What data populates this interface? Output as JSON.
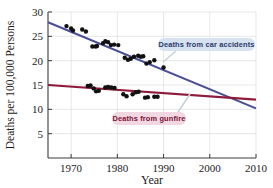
{
  "figure": {
    "background_color": "#ffffff",
    "plot_area": {
      "left": 48,
      "right": 256,
      "top": 12,
      "bottom": 158
    },
    "grid": "on",
    "grid_color": "#dcdcdc",
    "axis_color": "#3a3a3a"
  },
  "chart_data": {
    "type": "scatter",
    "title": "",
    "xlabel": "Year",
    "ylabel": "Deaths per 100,000 Persons",
    "xlim": [
      1965,
      2010
    ],
    "ylim": [
      0,
      30
    ],
    "xticks": [
      1970,
      1980,
      1990,
      2000,
      2010
    ],
    "yticks": [
      5,
      10,
      15,
      20,
      25,
      30
    ],
    "grid": true,
    "legend_position": "inline-annotations",
    "series": [
      {
        "name": "Deaths from car accidents",
        "color": "#4a4f93",
        "marker_color": "#111111",
        "annotation": "Deaths from car accidents",
        "annotation_bg": "#d6e2f0",
        "annotation_fg": "#2c3a6b",
        "trend_line": {
          "x": [
            1965,
            2010
          ],
          "y": [
            27.9,
            10.2
          ]
        },
        "points": [
          {
            "x": 1969,
            "y": 27.1
          },
          {
            "x": 1970,
            "y": 26.6
          },
          {
            "x": 1970.4,
            "y": 26.2
          },
          {
            "x": 1972.4,
            "y": 26.4
          },
          {
            "x": 1973.2,
            "y": 26.0
          },
          {
            "x": 1974.6,
            "y": 22.9
          },
          {
            "x": 1975.3,
            "y": 22.9
          },
          {
            "x": 1975.6,
            "y": 23.0
          },
          {
            "x": 1976.9,
            "y": 23.6
          },
          {
            "x": 1977.4,
            "y": 24.0
          },
          {
            "x": 1978.0,
            "y": 23.8
          },
          {
            "x": 1978.6,
            "y": 23.2
          },
          {
            "x": 1979.3,
            "y": 23.3
          },
          {
            "x": 1980.2,
            "y": 23.2
          },
          {
            "x": 1981.6,
            "y": 20.6
          },
          {
            "x": 1982.3,
            "y": 20.2
          },
          {
            "x": 1982.9,
            "y": 20.4
          },
          {
            "x": 1983.6,
            "y": 20.8
          },
          {
            "x": 1984.5,
            "y": 21.0
          },
          {
            "x": 1985.1,
            "y": 20.8
          },
          {
            "x": 1985.6,
            "y": 20.9
          },
          {
            "x": 1986.3,
            "y": 19.4
          },
          {
            "x": 1987.0,
            "y": 19.7
          },
          {
            "x": 1988.0,
            "y": 20.1
          },
          {
            "x": 1990.0,
            "y": 18.6
          }
        ]
      },
      {
        "name": "Deaths from gunfire",
        "color": "#8e1b3c",
        "marker_color": "#111111",
        "annotation": "Deaths from gunfire",
        "annotation_bg": "#f0d7e2",
        "annotation_fg": "#7a1233",
        "trend_line": {
          "x": [
            1965,
            2010
          ],
          "y": [
            15.0,
            12.0
          ]
        },
        "points": [
          {
            "x": 1973.6,
            "y": 14.8
          },
          {
            "x": 1974.2,
            "y": 14.9
          },
          {
            "x": 1974.9,
            "y": 14.3
          },
          {
            "x": 1975.4,
            "y": 13.7
          },
          {
            "x": 1976.0,
            "y": 13.8
          },
          {
            "x": 1977.4,
            "y": 14.5
          },
          {
            "x": 1978.0,
            "y": 14.6
          },
          {
            "x": 1978.7,
            "y": 14.5
          },
          {
            "x": 1979.4,
            "y": 14.4
          },
          {
            "x": 1981.3,
            "y": 13.1
          },
          {
            "x": 1982.0,
            "y": 12.7
          },
          {
            "x": 1983.3,
            "y": 13.1
          },
          {
            "x": 1984.0,
            "y": 13.5
          },
          {
            "x": 1984.6,
            "y": 13.6
          },
          {
            "x": 1986.0,
            "y": 12.4
          },
          {
            "x": 1986.6,
            "y": 12.5
          },
          {
            "x": 1988.0,
            "y": 12.6
          },
          {
            "x": 1988.7,
            "y": 12.6
          }
        ]
      }
    ],
    "annotations": [
      {
        "id": "car-accidents-label",
        "text": "Deaths from car accidents",
        "box_x": 158,
        "box_y": 38,
        "box_w": 97,
        "box_h": 13,
        "bg": "#d6e2f0",
        "fg": "#2c3a6b",
        "leader": {
          "x1": 176,
          "y1": 51,
          "x2": 163,
          "y2": 62
        }
      },
      {
        "id": "gunfire-label",
        "text": "Deaths from gunfire",
        "box_x": 112,
        "box_y": 112,
        "box_w": 74,
        "box_h": 13,
        "bg": "#f0d7e2",
        "fg": "#7a1233",
        "leader": {
          "x1": 178,
          "y1": 112,
          "x2": 190,
          "y2": 94
        }
      }
    ]
  },
  "axes": {
    "x_title": "Year",
    "y_title": "Deaths per 100,000 Persons",
    "x_tick_labels": [
      "1970",
      "1980",
      "1990",
      "2000",
      "2010"
    ],
    "y_tick_labels": [
      "5",
      "10",
      "15",
      "20",
      "25",
      "30"
    ]
  }
}
